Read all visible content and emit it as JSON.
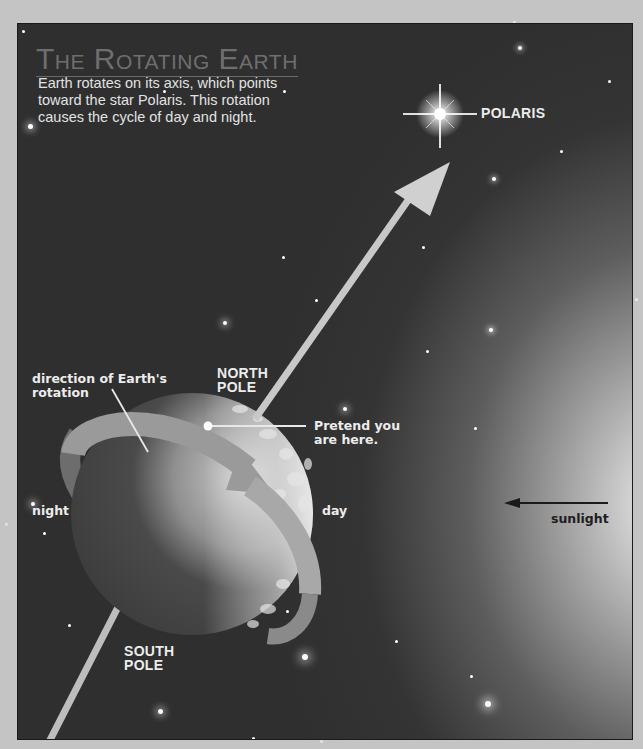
{
  "title": "The Rotating Earth",
  "caption": {
    "line1": "Earth rotates on its axis, which points",
    "line2": "toward the star Polaris. This rotation",
    "line3": "causes the cycle of day and night."
  },
  "labels": {
    "polaris": "POLARIS",
    "direction_line1": "direction of Earth's",
    "direction_line2": "rotation",
    "north_pole_line1": "NORTH",
    "north_pole_line2": "POLE",
    "pretend_line1": "Pretend you",
    "pretend_line2": "are here.",
    "night": "night",
    "day": "day",
    "sunlight": "sunlight",
    "south_pole_line1": "SOUTH",
    "south_pole_line2": "POLE"
  },
  "icons": {
    "polaris_star": "sparkle-star-icon",
    "axis_arrow": "arrow-up-right-icon",
    "rotation_arrow": "curved-arrow-icon",
    "sunlight_arrow": "arrow-left-icon",
    "location_marker": "dot-marker-icon"
  },
  "colors": {
    "panel_background": "#2f2f2f",
    "page_background": "#c4c4c4",
    "title": "#6e6e6e",
    "text_light": "#ececec",
    "text_dark": "#1e1e1e",
    "axis": "#c8c8c8"
  }
}
